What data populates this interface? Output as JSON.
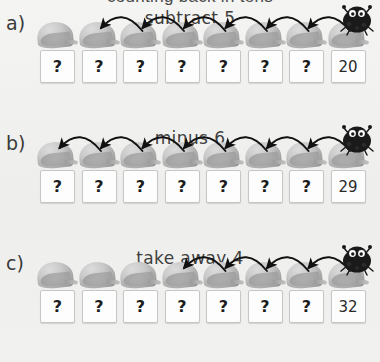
{
  "worksheet": {
    "cropped_top_text": "counting back in tens",
    "background_color": "#f1f1ef",
    "leaf_color": "#a9a9a9",
    "bug_color": "#1a1a1a",
    "box_fill": "#fdfdfd",
    "arrow_color": "#111111"
  },
  "rows": [
    {
      "label": "a)",
      "title": "subtract 5",
      "arrow_count": 6,
      "leaf_count": 8,
      "boxes": [
        "?",
        "?",
        "?",
        "?",
        "?",
        "?",
        "?",
        "20"
      ],
      "answer": "20"
    },
    {
      "label": "b)",
      "title": "minus 6",
      "arrow_count": 7,
      "leaf_count": 8,
      "boxes": [
        "?",
        "?",
        "?",
        "?",
        "?",
        "?",
        "?",
        "29"
      ],
      "answer": "29"
    },
    {
      "label": "c)",
      "title": "take away 4",
      "arrow_count": 4,
      "leaf_count": 8,
      "boxes": [
        "?",
        "?",
        "?",
        "?",
        "?",
        "?",
        "?",
        "32"
      ],
      "answer": "32"
    }
  ]
}
